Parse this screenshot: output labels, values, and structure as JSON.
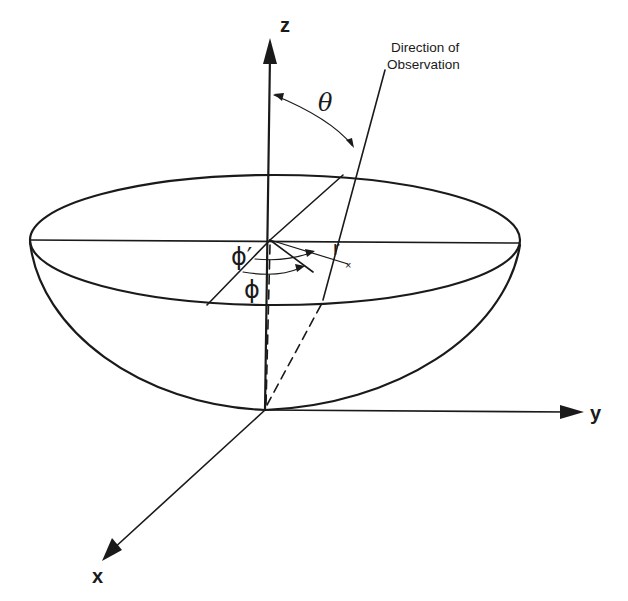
{
  "diagram": {
    "labels": {
      "z_axis": "z",
      "y_axis": "y",
      "x_axis": "x",
      "theta": "θ",
      "phi_prime": "ϕ′",
      "phi": "ϕ",
      "r": "r",
      "observation_line1": "Direction of",
      "observation_line2": "Observation"
    },
    "colors": {
      "stroke": "#1a1a1a",
      "background": "#ffffff"
    }
  }
}
